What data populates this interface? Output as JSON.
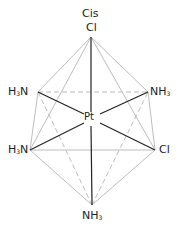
{
  "diagram": {
    "title": "Cis",
    "center_atom": "Pt",
    "ligands": {
      "top": "Cl",
      "upper_left": "H3N",
      "upper_right": "NH3",
      "lower_left": "H3N",
      "lower_right": "Cl",
      "bottom": "NH3"
    },
    "geometry": "octahedral",
    "colors": {
      "bond": "#222222",
      "edge": "#bbbbbb"
    }
  }
}
